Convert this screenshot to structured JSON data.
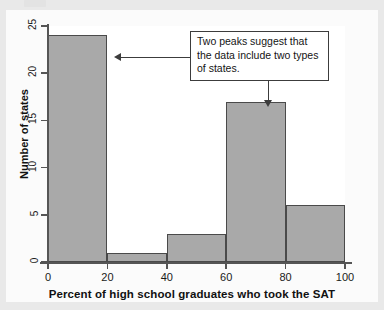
{
  "chart_data": {
    "type": "bar",
    "title": "",
    "subtitle": "",
    "xlabel": "Percent of high school graduates who took the SAT",
    "ylabel": "Number of states",
    "categories": [
      "0-20",
      "20-40",
      "40-60",
      "60-80",
      "80-100"
    ],
    "bin_edges": [
      0,
      20,
      40,
      60,
      80,
      100
    ],
    "values": [
      24,
      1,
      3,
      17,
      6
    ],
    "xlim": [
      0,
      100
    ],
    "ylim": [
      0,
      25
    ],
    "xticks": [
      "0",
      "20",
      "40",
      "60",
      "80",
      "100"
    ],
    "xtick_values": [
      0,
      20,
      40,
      60,
      80,
      100
    ],
    "yticks": [
      "0",
      "5",
      "10",
      "15",
      "20",
      "25"
    ],
    "ytick_values": [
      0,
      5,
      10,
      15,
      20,
      25
    ],
    "grid": false,
    "legend": null,
    "bar_fill_color": "#a9a9a9",
    "bar_edge_color": "#4a4a4a",
    "annotations": [
      {
        "text": "Two peaks suggest that the data include two types of states.",
        "points_to": [
          "bar-0-20",
          "bar-60-80"
        ]
      }
    ]
  },
  "axes": {
    "y_title": "Number of states",
    "x_title": "Percent of high school graduates who took the SAT",
    "y_ticks": [
      {
        "label": "0",
        "value": 0
      },
      {
        "label": "5",
        "value": 5
      },
      {
        "label": "10",
        "value": 10
      },
      {
        "label": "15",
        "value": 15
      },
      {
        "label": "20",
        "value": 20
      },
      {
        "label": "25",
        "value": 25
      }
    ],
    "x_ticks": [
      {
        "label": "0",
        "value": 0
      },
      {
        "label": "20",
        "value": 20
      },
      {
        "label": "40",
        "value": 40
      },
      {
        "label": "60",
        "value": 60
      },
      {
        "label": "80",
        "value": 80
      },
      {
        "label": "100",
        "value": 100
      }
    ]
  },
  "bars": [
    {
      "name": "bar-0-20",
      "start": 0,
      "end": 20,
      "value": 24
    },
    {
      "name": "bar-20-40",
      "start": 20,
      "end": 40,
      "value": 1
    },
    {
      "name": "bar-40-60",
      "start": 40,
      "end": 60,
      "value": 3
    },
    {
      "name": "bar-60-80",
      "start": 60,
      "end": 80,
      "value": 17
    },
    {
      "name": "bar-80-100",
      "start": 80,
      "end": 100,
      "value": 6
    }
  ],
  "annotation": {
    "line1": "Two peaks suggest that",
    "line2": "the data include two types",
    "line3": "of states."
  }
}
